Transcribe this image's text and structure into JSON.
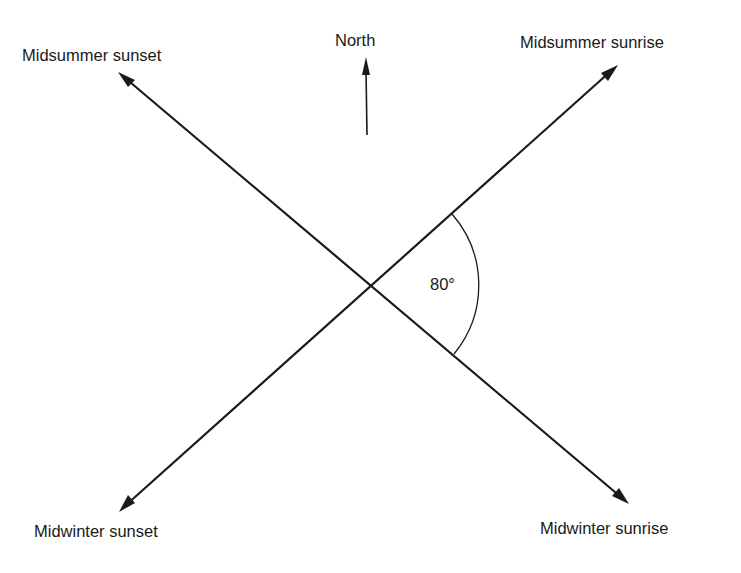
{
  "diagram": {
    "type": "solar-alignment-diagram",
    "north": {
      "label": "North",
      "icon": "north-arrow-icon"
    },
    "directions": [
      {
        "id": "midsummer-sunset",
        "label": "Midsummer sunset",
        "position": "top-left"
      },
      {
        "id": "midsummer-sunrise",
        "label": "Midsummer sunrise",
        "position": "top-right"
      },
      {
        "id": "midwinter-sunset",
        "label": "Midwinter sunset",
        "position": "bottom-left"
      },
      {
        "id": "midwinter-sunrise",
        "label": "Midwinter sunrise",
        "position": "bottom-right"
      }
    ],
    "angle": {
      "label": "80°",
      "value": 80,
      "between": [
        "midsummer-sunrise",
        "midwinter-sunrise"
      ]
    },
    "colors": {
      "ink": "#1a1a1a",
      "background": "#ffffff"
    }
  }
}
